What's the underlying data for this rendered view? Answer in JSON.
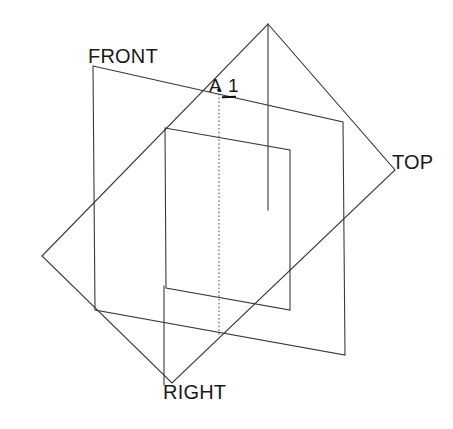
{
  "diagram": {
    "background_color": "#ffffff",
    "line_color": "#3a3a3a",
    "hidden_line_color": "#4a4a4a",
    "text_color": "#1a1a1a",
    "labels": {
      "front": "FRONT",
      "top": "TOP",
      "right": "RIGHT",
      "point_name": "A",
      "point_index": "1"
    },
    "elements": {
      "front_plane": "front-plane-outline",
      "top_plane": "top-plane-outline",
      "right_plane": "right-plane-outline",
      "inner_plane": "inner-plane-outline",
      "projection_line": "vertical-projection-line",
      "point_marker": "point-a1-marker"
    },
    "geometry": {
      "front_plane_points": "93,66 343,122 345,355 95,310",
      "top_plane_points": "42,256 268,24 395,170 172,383",
      "right_plane_points": "165,128 290,150 290,310 166,288",
      "projection_line": "219,90 219,337"
    }
  }
}
